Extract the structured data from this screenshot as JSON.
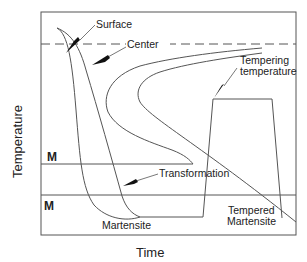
{
  "diagram": {
    "type": "time-temperature transformation (quench and temper) diagram",
    "axes": {
      "x_label": "Time",
      "y_label": "Temperature"
    },
    "lines": {
      "center_dashed": "Center",
      "ms_label": "M",
      "mf_label": "M"
    },
    "annotations": {
      "surface": "Surface",
      "center": "Center",
      "tempering_line1": "Tempering",
      "tempering_line2": "temperature",
      "transformation": "Transformation",
      "martensite": "Martensite",
      "tempered_line1": "Tempered",
      "tempered_line2": "Martensite"
    },
    "colors": {
      "line": "#444444",
      "text": "#222222",
      "background": "#ffffff"
    }
  }
}
